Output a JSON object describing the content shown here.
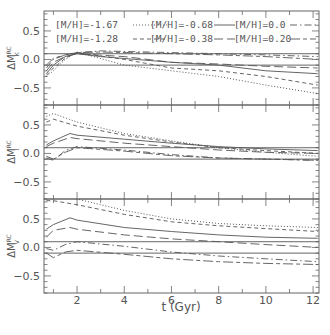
{
  "chart_data": [
    {
      "type": "line",
      "panel": "top",
      "ylabel": "ΔM_K^RC",
      "xlabel": "",
      "xlim": [
        0.6,
        12.25
      ],
      "ylim": [
        -0.8,
        0.85
      ],
      "yticks": [
        "0.5",
        "0.0",
        "−0.5"
      ],
      "reference_lines": [
        0.1,
        -0.1
      ],
      "series": [
        {
          "name": "[M/H]=-1.67",
          "style": "dotted",
          "x": [
            0.7,
            1.0,
            1.5,
            2.0,
            4,
            6,
            8,
            10,
            12.2
          ],
          "values": [
            -0.3,
            -0.2,
            0.0,
            0.13,
            -0.1,
            -0.2,
            -0.3,
            -0.45,
            -0.6
          ]
        },
        {
          "name": "[M/H]=-1.28",
          "style": "short-dash",
          "x": [
            0.7,
            1.0,
            1.5,
            2.0,
            4,
            6,
            8,
            10,
            12.2
          ],
          "values": [
            -0.28,
            -0.15,
            0.02,
            0.12,
            0.0,
            -0.15,
            -0.2,
            -0.3,
            -0.45
          ]
        },
        {
          "name": "[M/H]=-0.68",
          "style": "solid",
          "x": [
            0.7,
            1.0,
            1.5,
            2.0,
            3,
            6,
            8,
            10,
            12.2
          ],
          "values": [
            -0.25,
            -0.1,
            0.05,
            0.1,
            0.05,
            -0.05,
            -0.1,
            -0.2,
            -0.25
          ]
        },
        {
          "name": "[M/H]=-0.38",
          "style": "long-dash",
          "x": [
            0.7,
            1.0,
            1.5,
            2.0,
            4,
            6,
            8,
            10,
            12.2
          ],
          "values": [
            -0.2,
            -0.05,
            0.05,
            0.1,
            0.05,
            -0.05,
            -0.08,
            -0.12,
            -0.15
          ]
        },
        {
          "name": "[M/H]=0.0",
          "style": "dash-dot",
          "x": [
            0.7,
            1.0,
            1.5,
            2.0,
            3,
            6,
            8,
            10,
            12.2
          ],
          "values": [
            -0.15,
            0.0,
            0.08,
            0.12,
            0.15,
            0.12,
            0.1,
            0.08,
            0.05
          ]
        },
        {
          "name": "[M/H]=0.20",
          "style": "long-short-dash",
          "x": [
            0.7,
            1.0,
            1.5,
            2.0,
            3,
            6,
            8,
            10,
            12.2
          ],
          "values": [
            -0.1,
            0.02,
            0.08,
            0.12,
            0.13,
            0.1,
            0.08,
            0.05,
            0.0
          ]
        }
      ]
    },
    {
      "type": "line",
      "panel": "middle",
      "ylabel": "ΔM_I^RC",
      "xlabel": "",
      "xlim": [
        0.6,
        12.25
      ],
      "ylim": [
        -0.8,
        0.85
      ],
      "yticks": [
        "0.5",
        "0.0",
        "−0.5"
      ],
      "reference_lines": [
        0.1,
        -0.1
      ],
      "series": [
        {
          "name": "[M/H]=-1.67",
          "style": "dotted",
          "x": [
            0.7,
            1.0,
            2.0,
            4,
            6,
            8,
            10,
            12.2
          ],
          "values": [
            0.65,
            0.7,
            0.55,
            0.35,
            0.22,
            0.1,
            0.02,
            -0.05
          ]
        },
        {
          "name": "[M/H]=-1.28",
          "style": "short-dash",
          "x": [
            0.7,
            1.0,
            2.0,
            4,
            6,
            8,
            10,
            12.2
          ],
          "values": [
            0.55,
            0.6,
            0.48,
            0.32,
            0.2,
            0.1,
            0.05,
            0.0
          ]
        },
        {
          "name": "[M/H]=-0.68",
          "style": "solid",
          "x": [
            0.7,
            1.0,
            1.7,
            2.0,
            4,
            6,
            8,
            10,
            12.2
          ],
          "values": [
            0.15,
            0.22,
            0.35,
            0.32,
            0.25,
            0.18,
            0.12,
            0.08,
            0.05
          ]
        },
        {
          "name": "[M/H]=-0.38",
          "style": "long-dash",
          "x": [
            0.7,
            1.0,
            1.7,
            2.0,
            4,
            6,
            8,
            10,
            12.2
          ],
          "values": [
            0.12,
            0.18,
            0.28,
            0.26,
            0.18,
            0.12,
            0.06,
            0.02,
            0.0
          ]
        },
        {
          "name": "[M/H]=0.0",
          "style": "dash-dot",
          "x": [
            0.7,
            1.0,
            1.5,
            2.0,
            4,
            6,
            8,
            10,
            12.2
          ],
          "values": [
            -0.08,
            -0.12,
            0.05,
            0.12,
            0.06,
            -0.02,
            -0.08,
            -0.1,
            -0.12
          ]
        },
        {
          "name": "[M/H]=0.20",
          "style": "long-short-dash",
          "x": [
            0.7,
            1.0,
            1.5,
            2.0,
            4,
            6,
            8,
            10,
            12.2
          ],
          "values": [
            -0.05,
            -0.1,
            0.02,
            0.1,
            0.04,
            -0.04,
            -0.08,
            -0.1,
            -0.12
          ]
        }
      ]
    },
    {
      "type": "line",
      "panel": "bottom",
      "ylabel": "ΔM_V^RC",
      "xlabel": "t (Gyr)",
      "xlim": [
        0.6,
        12.25
      ],
      "ylim": [
        -0.8,
        0.85
      ],
      "xticks": [
        "2",
        "4",
        "6",
        "8",
        "10",
        "12"
      ],
      "yticks": [
        "0.5",
        "0.0",
        "−0.5"
      ],
      "reference_lines": [
        0.1,
        -0.1
      ],
      "series": [
        {
          "name": "[M/H]=-1.67",
          "style": "dotted",
          "x": [
            0.7,
            1.0,
            2.0,
            4,
            6,
            8,
            10,
            12.2
          ],
          "values": [
            0.9,
            0.9,
            0.85,
            0.65,
            0.5,
            0.42,
            0.38,
            0.35
          ]
        },
        {
          "name": "[M/H]=-1.28",
          "style": "short-dash",
          "x": [
            0.7,
            1.0,
            2.0,
            4,
            6,
            8,
            10,
            12.2
          ],
          "values": [
            0.82,
            0.82,
            0.75,
            0.58,
            0.45,
            0.38,
            0.33,
            0.28
          ]
        },
        {
          "name": "[M/H]=-0.68",
          "style": "solid",
          "x": [
            0.7,
            1.0,
            1.7,
            2.0,
            4,
            6,
            8,
            10,
            12.2
          ],
          "values": [
            0.32,
            0.4,
            0.52,
            0.48,
            0.35,
            0.28,
            0.22,
            0.18,
            0.16
          ]
        },
        {
          "name": "[M/H]=-0.38",
          "style": "long-dash",
          "x": [
            0.7,
            1.0,
            1.7,
            2.0,
            4,
            6,
            8,
            10,
            12.2
          ],
          "values": [
            0.18,
            0.3,
            0.35,
            0.32,
            0.22,
            0.15,
            0.1,
            0.05,
            0.0
          ]
        },
        {
          "name": "[M/H]=0.0",
          "style": "dash-dot",
          "x": [
            0.7,
            1.0,
            1.5,
            2.0,
            4,
            6,
            8,
            10,
            12.2
          ],
          "values": [
            -0.02,
            -0.05,
            0.05,
            0.1,
            0.02,
            -0.08,
            -0.15,
            -0.2,
            -0.25
          ]
        },
        {
          "name": "[M/H]=0.20",
          "style": "long-short-dash",
          "x": [
            0.7,
            1.0,
            1.5,
            2.0,
            4,
            6,
            8,
            10,
            12.2
          ],
          "values": [
            -0.1,
            -0.18,
            -0.08,
            -0.05,
            -0.12,
            -0.2,
            -0.25,
            -0.28,
            -0.3
          ]
        }
      ]
    }
  ],
  "legend": {
    "entries": [
      {
        "label": "[M/H]=-1.67",
        "style": "dotted"
      },
      {
        "label": "[M/H]=-1.28",
        "style": "short-dash"
      },
      {
        "label": "[M/H]=-0.68",
        "style": "solid"
      },
      {
        "label": "[M/H]=-0.38",
        "style": "long-dash"
      },
      {
        "label": "[M/H]=0.0",
        "style": "dash-dot"
      },
      {
        "label": "[M/H]=0.20",
        "style": "long-short-dash"
      }
    ]
  },
  "axes": {
    "xlabel": "t (Gyr)",
    "xticks": [
      "2",
      "4",
      "6",
      "8",
      "10",
      "12"
    ],
    "yticks": [
      "0.5",
      "0.0",
      "−0.5"
    ],
    "ylabels": {
      "top": "ΔM",
      "top_sub": "K",
      "middle_sub": "I",
      "bottom_sub": "V",
      "sup": "RC"
    }
  },
  "colors": {
    "line": "#555555",
    "frame": "#666666",
    "text": "#555555"
  }
}
